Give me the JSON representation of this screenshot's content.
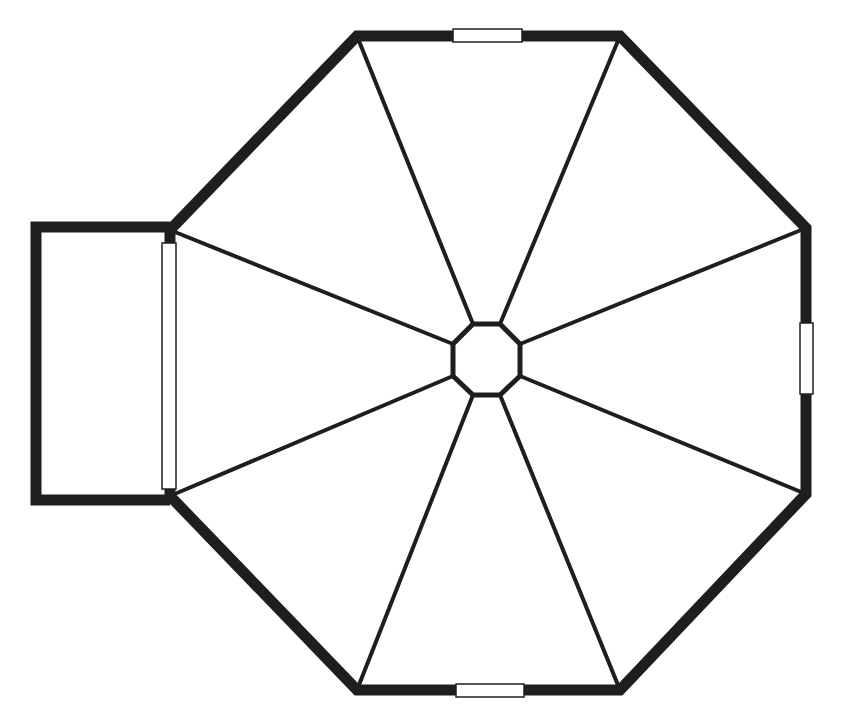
{
  "diagram": {
    "type": "floor-plan",
    "colors": {
      "wall": "#1e1e1e",
      "background": "#ffffff",
      "window_fill": "#ffffff"
    },
    "outer_octagon": [
      [
        357,
        36
      ],
      [
        620,
        36
      ],
      [
        806,
        228
      ],
      [
        806,
        494
      ],
      [
        620,
        690
      ],
      [
        357,
        690
      ],
      [
        170,
        496
      ],
      [
        170,
        230
      ]
    ],
    "inner_octagon": [
      [
        473,
        324
      ],
      [
        500,
        324
      ],
      [
        520,
        344
      ],
      [
        520,
        376
      ],
      [
        500,
        395
      ],
      [
        473,
        395
      ],
      [
        453,
        376
      ],
      [
        453,
        344
      ]
    ],
    "annex": [
      [
        170,
        227
      ],
      [
        36,
        227
      ],
      [
        36,
        500
      ],
      [
        170,
        500
      ]
    ],
    "windows": [
      {
        "name": "top-window",
        "x": 453,
        "y": 29,
        "w": 69,
        "h": 13
      },
      {
        "name": "right-window",
        "x": 800,
        "y": 323,
        "w": 13,
        "h": 71
      },
      {
        "name": "bottom-window",
        "x": 456,
        "y": 684,
        "w": 68,
        "h": 13
      },
      {
        "name": "left-annex-window",
        "x": 162,
        "y": 243,
        "w": 14,
        "h": 246
      }
    ]
  }
}
